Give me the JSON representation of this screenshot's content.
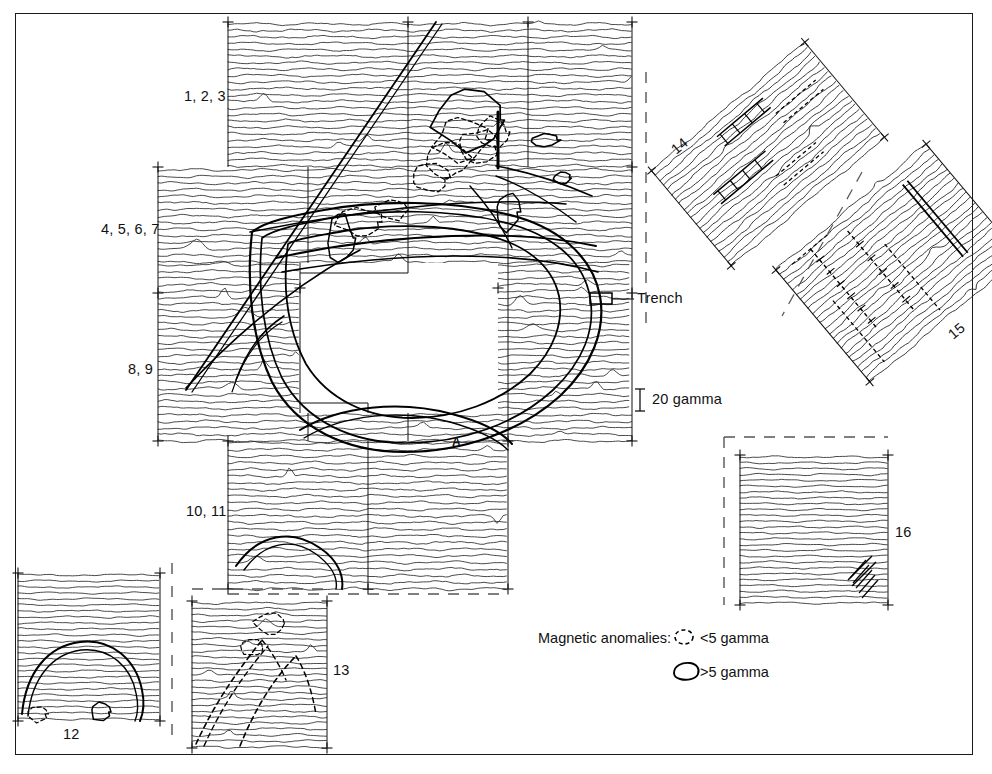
{
  "figure": {
    "type": "magnetometer-survey-plot",
    "border_color": "#1a1a1a",
    "trace_color": "#2a2a2a",
    "anomaly_color": "#000000"
  },
  "labels": {
    "block_1": "1, 2, 3",
    "block_2": "4, 5, 6, 7",
    "block_3": "8, 9",
    "block_4": "10, 11",
    "block_12": "12",
    "block_13": "13",
    "block_14": "14",
    "block_15": "15",
    "block_16": "16",
    "feature_a": "A",
    "trench": "Trench"
  },
  "scale_bar": {
    "value": "20 gamma",
    "units": "gamma",
    "magnitude": 20
  },
  "legend": {
    "title": "Magnetic anomalies:",
    "entries": [
      {
        "symbol": "dashed-oval",
        "label": "<5 gamma",
        "threshold": 5,
        "comparator": "<"
      },
      {
        "symbol": "solid-oval",
        "label": ">5 gamma",
        "threshold": 5,
        "comparator": ">"
      }
    ]
  },
  "chart_data": {
    "type": "line",
    "xlabel": "",
    "ylabel": "",
    "grid": false,
    "legend_position": "bottom-right",
    "series_description": "Stacked horizontal magnetometer traverse traces; vertical deflection proportional to magnetic field anomaly in gamma",
    "scale_reference_gamma": 20,
    "anomaly_classes": [
      "<5 gamma",
      ">5 gamma"
    ],
    "survey_blocks": [
      {
        "id": "1, 2, 3",
        "x": 228,
        "y": 22,
        "w": 180,
        "h": 145,
        "traces": 22,
        "rotation": 0
      },
      {
        "id": "top-right-a",
        "x": 408,
        "y": 22,
        "w": 120,
        "h": 145,
        "traces": 22,
        "rotation": 0
      },
      {
        "id": "top-right-b",
        "x": 528,
        "y": 22,
        "w": 104,
        "h": 145,
        "traces": 22,
        "rotation": 0
      },
      {
        "id": "4, 5, 6, 7",
        "x": 158,
        "y": 167,
        "w": 150,
        "h": 126,
        "traces": 19,
        "rotation": 0
      },
      {
        "id": "8, 9",
        "x": 158,
        "y": 293,
        "w": 150,
        "h": 148,
        "traces": 22,
        "rotation": 0
      },
      {
        "id": "10, 11",
        "x": 228,
        "y": 441,
        "w": 180,
        "h": 148,
        "traces": 22,
        "rotation": 0
      },
      {
        "id": "12",
        "x": 18,
        "y": 573,
        "w": 142,
        "h": 147,
        "traces": 24,
        "rotation": 0
      },
      {
        "id": "13",
        "x": 192,
        "y": 601,
        "w": 135,
        "h": 147,
        "traces": 24,
        "rotation": 0
      },
      {
        "id": "14",
        "x": 668,
        "y": 88,
        "w": 200,
        "h": 130,
        "traces": 21,
        "rotation": -40
      },
      {
        "id": "15",
        "x": 790,
        "y": 178,
        "w": 200,
        "h": 150,
        "traces": 23,
        "rotation": -40
      },
      {
        "id": "16",
        "x": 740,
        "y": 455,
        "w": 148,
        "h": 150,
        "traces": 25,
        "rotation": 0
      }
    ],
    "unsurveyed_gap": {
      "x": 300,
      "y": 263,
      "w": 198,
      "h": 150
    }
  }
}
